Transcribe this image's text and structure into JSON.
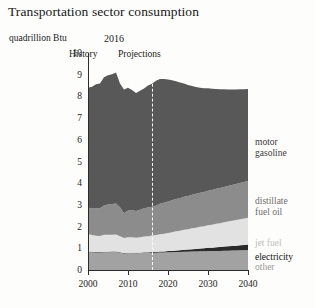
{
  "chart_data": {
    "type": "area",
    "stacked": true,
    "title": "Transportation sector consumption",
    "subtitle": "quadrillion Btu",
    "ylabel": "quadrillion Btu",
    "xlabel": "",
    "ylim": [
      0,
      10
    ],
    "xlim": [
      2000,
      2040
    ],
    "grid": false,
    "legend_position": "right-inline",
    "yticks": [
      "10",
      "9",
      "8",
      "7",
      "6",
      "5",
      "4",
      "3",
      "2",
      "1",
      "0"
    ],
    "ytick_values": [
      10,
      9,
      8,
      7,
      6,
      5,
      4,
      3,
      2,
      1,
      0
    ],
    "xticks": [
      "2000",
      "2010",
      "2020",
      "2030",
      "2040"
    ],
    "xtick_values": [
      2000,
      2010,
      2020,
      2030,
      2040
    ],
    "annotations": {
      "divider_year": "2016",
      "divider_value": 2016,
      "left_region": "History",
      "right_region": "Projections"
    },
    "colors": {
      "motor_gasoline": "#585858",
      "distillate_fuel_oil": "#8c8c8c",
      "jet_fuel": "#e2e2e2",
      "electricity": "#2a2a2a",
      "other": "#a2a2a2",
      "axis": "#2b2b2b",
      "divider": "#ffffff",
      "background": "#fdfdfb"
    },
    "x": [
      2000,
      2001,
      2002,
      2003,
      2004,
      2005,
      2006,
      2007,
      2008,
      2009,
      2010,
      2011,
      2012,
      2013,
      2014,
      2015,
      2016,
      2017,
      2018,
      2019,
      2020,
      2021,
      2022,
      2023,
      2024,
      2025,
      2026,
      2027,
      2028,
      2029,
      2030,
      2031,
      2032,
      2033,
      2034,
      2035,
      2036,
      2037,
      2038,
      2039,
      2040
    ],
    "series": [
      {
        "name": "other",
        "label": "other",
        "color": "#a2a2a2",
        "values": [
          0.82,
          0.82,
          0.81,
          0.81,
          0.82,
          0.82,
          0.83,
          0.83,
          0.8,
          0.76,
          0.78,
          0.78,
          0.77,
          0.78,
          0.79,
          0.79,
          0.8,
          0.8,
          0.81,
          0.81,
          0.82,
          0.82,
          0.83,
          0.83,
          0.84,
          0.84,
          0.85,
          0.85,
          0.86,
          0.86,
          0.87,
          0.87,
          0.88,
          0.88,
          0.89,
          0.89,
          0.9,
          0.9,
          0.91,
          0.91,
          0.92
        ]
      },
      {
        "name": "electricity",
        "label": "electricity",
        "color": "#2a2a2a",
        "values": [
          0.02,
          0.02,
          0.02,
          0.02,
          0.02,
          0.02,
          0.02,
          0.02,
          0.02,
          0.02,
          0.02,
          0.02,
          0.02,
          0.02,
          0.03,
          0.03,
          0.03,
          0.03,
          0.04,
          0.04,
          0.05,
          0.06,
          0.07,
          0.08,
          0.09,
          0.1,
          0.11,
          0.12,
          0.13,
          0.14,
          0.15,
          0.16,
          0.17,
          0.18,
          0.19,
          0.2,
          0.21,
          0.22,
          0.23,
          0.24,
          0.25
        ]
      },
      {
        "name": "jet_fuel",
        "label": "jet fuel",
        "color": "#e2e2e2",
        "values": [
          0.82,
          0.77,
          0.75,
          0.74,
          0.78,
          0.79,
          0.78,
          0.79,
          0.74,
          0.69,
          0.71,
          0.71,
          0.7,
          0.71,
          0.72,
          0.74,
          0.76,
          0.78,
          0.8,
          0.82,
          0.84,
          0.86,
          0.88,
          0.9,
          0.92,
          0.94,
          0.96,
          0.98,
          1.0,
          1.02,
          1.04,
          1.06,
          1.08,
          1.1,
          1.12,
          1.14,
          1.16,
          1.18,
          1.2,
          1.22,
          1.24
        ]
      },
      {
        "name": "distillate_fuel_oil",
        "label": "distillate fuel oil",
        "color": "#8c8c8c",
        "values": [
          1.22,
          1.22,
          1.25,
          1.27,
          1.35,
          1.39,
          1.41,
          1.43,
          1.33,
          1.15,
          1.23,
          1.25,
          1.23,
          1.27,
          1.31,
          1.32,
          1.32,
          1.36,
          1.4,
          1.43,
          1.45,
          1.47,
          1.49,
          1.5,
          1.52,
          1.53,
          1.55,
          1.56,
          1.57,
          1.58,
          1.59,
          1.6,
          1.61,
          1.62,
          1.63,
          1.64,
          1.65,
          1.66,
          1.67,
          1.68,
          1.69
        ]
      },
      {
        "name": "motor_gasoline",
        "label": "motor gasoline",
        "color": "#585858",
        "values": [
          5.52,
          5.61,
          5.73,
          5.76,
          5.91,
          5.95,
          5.98,
          6.03,
          5.71,
          5.7,
          5.66,
          5.54,
          5.44,
          5.48,
          5.51,
          5.62,
          5.67,
          5.75,
          5.75,
          5.7,
          5.62,
          5.53,
          5.43,
          5.33,
          5.22,
          5.11,
          5.01,
          4.92,
          4.84,
          4.78,
          4.72,
          4.66,
          4.6,
          4.55,
          4.5,
          4.45,
          4.4,
          4.36,
          4.32,
          4.28,
          4.24
        ]
      }
    ],
    "totals": [
      8.4,
      8.44,
      8.56,
      8.6,
      8.88,
      8.97,
      9.02,
      9.1,
      8.6,
      8.32,
      8.4,
      8.3,
      8.16,
      8.26,
      8.36,
      8.5,
      8.58,
      8.72,
      8.8,
      8.8,
      8.78,
      8.74,
      8.7,
      8.64,
      8.59,
      8.52,
      8.48,
      8.43,
      8.4,
      8.38,
      8.37,
      8.35,
      8.34,
      8.33,
      8.33,
      8.32,
      8.32,
      8.32,
      8.33,
      8.33,
      8.34
    ]
  },
  "labels": {
    "motor_gasoline_line1": "motor",
    "motor_gasoline_line2": "gasoline",
    "distillate_line1": "distillate",
    "distillate_line2": "fuel oil",
    "jet_fuel": "jet fuel",
    "electricity": "electricity",
    "other": "other"
  }
}
